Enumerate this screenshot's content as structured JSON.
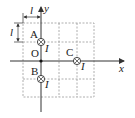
{
  "diagram": {
    "axes": {
      "x_label": "x",
      "y_label": "y",
      "origin_label": "O"
    },
    "dimension": {
      "horizontal_label": "l",
      "vertical_label": "l"
    },
    "wires": [
      {
        "name": "A",
        "current_label": "I",
        "direction": "into-page"
      },
      {
        "name": "B",
        "current_label": "I",
        "direction": "into-page"
      },
      {
        "name": "C",
        "current_label": "I",
        "direction": "into-page"
      }
    ],
    "grid": {
      "cell_size_label": "l",
      "columns": 4,
      "rows": 4
    }
  }
}
